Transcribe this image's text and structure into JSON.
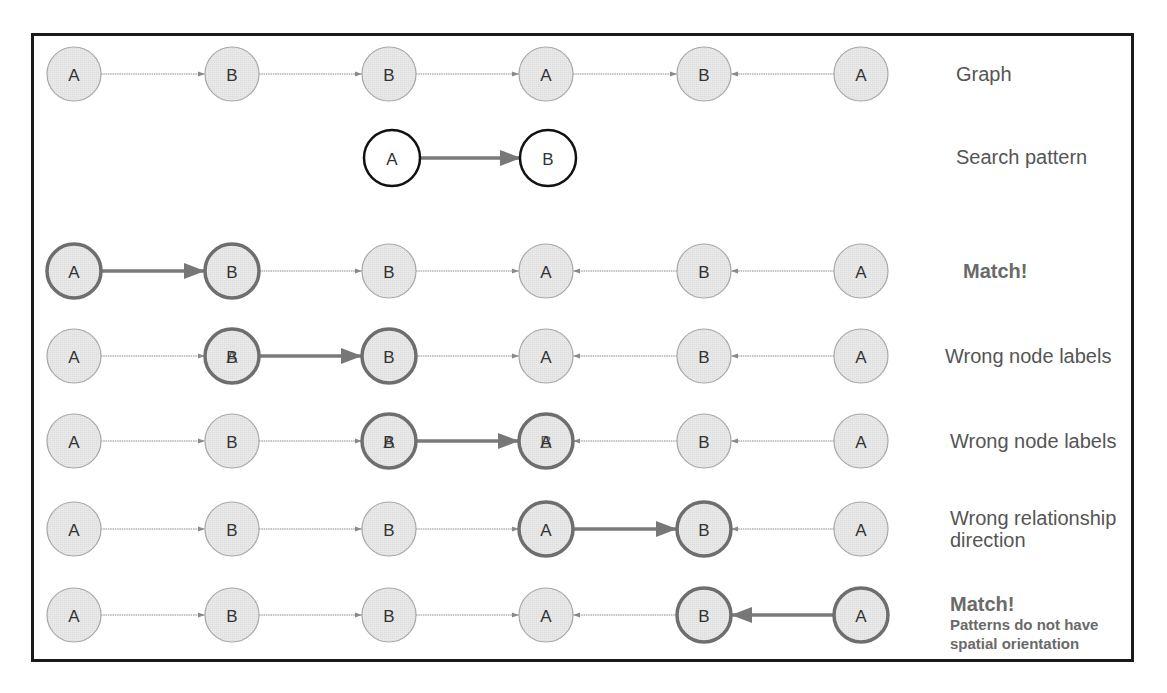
{
  "diagram": {
    "colors": {
      "node_fill": "#e6e6e6",
      "node_stroke": "#a8a8a8",
      "highlight_stroke": "#6e6e6e",
      "pattern_stroke": "#111111",
      "edge_thin": "#8a8a8a",
      "edge_thick": "#7a7a7a",
      "label_text": "#555555"
    },
    "node_x": [
      74,
      232,
      389,
      546,
      704,
      861
    ],
    "rows": [
      {
        "id": "graph",
        "y": 74,
        "label": "Graph",
        "sub": "",
        "bold": false,
        "nodes": [
          "A",
          "B",
          "B",
          "A",
          "B",
          "A"
        ],
        "overlay": [
          "",
          "",
          "",
          "",
          "",
          ""
        ],
        "edges": [
          "right",
          "right",
          "right",
          "right",
          "left"
        ],
        "highlight_nodes": [],
        "highlight_edge": -1
      },
      {
        "id": "match-1",
        "y": 271,
        "label": "Match!",
        "sub": "",
        "bold": true,
        "nodes": [
          "A",
          "B",
          "B",
          "A",
          "B",
          "A"
        ],
        "overlay": [
          "",
          "",
          "",
          "",
          "",
          ""
        ],
        "edges": [
          "right",
          "right",
          "right",
          "left",
          "left"
        ],
        "highlight_nodes": [
          0,
          1
        ],
        "highlight_edge": 0
      },
      {
        "id": "wrong-labels-1",
        "y": 356,
        "label": "Wrong node labels",
        "sub": "",
        "bold": false,
        "nodes": [
          "A",
          "B",
          "B",
          "A",
          "B",
          "A"
        ],
        "overlay": [
          "",
          "A",
          "",
          "",
          "",
          ""
        ],
        "edges": [
          "right",
          "right",
          "right",
          "left",
          "left"
        ],
        "highlight_nodes": [
          1,
          2
        ],
        "highlight_edge": 1
      },
      {
        "id": "wrong-labels-2",
        "y": 441,
        "label": "Wrong node labels",
        "sub": "",
        "bold": false,
        "nodes": [
          "A",
          "B",
          "B",
          "A",
          "B",
          "A"
        ],
        "overlay": [
          "",
          "",
          "A",
          "B",
          "",
          ""
        ],
        "edges": [
          "right",
          "right",
          "right",
          "left",
          "left"
        ],
        "highlight_nodes": [
          2,
          3
        ],
        "highlight_edge": 2
      },
      {
        "id": "wrong-direction",
        "y": 529,
        "label": "Wrong relationship",
        "sub": "direction",
        "bold": false,
        "nodes": [
          "A",
          "B",
          "B",
          "A",
          "B",
          "A"
        ],
        "overlay": [
          "",
          "",
          "",
          "",
          "",
          ""
        ],
        "edges": [
          "right",
          "right",
          "right",
          "right",
          "left"
        ],
        "highlight_nodes": [
          3,
          4
        ],
        "highlight_edge": 3
      },
      {
        "id": "match-2",
        "y": 615,
        "label": "Match!",
        "sub": "Patterns do not have spatial orientation",
        "bold": true,
        "nodes": [
          "A",
          "B",
          "B",
          "A",
          "B",
          "A"
        ],
        "overlay": [
          "",
          "",
          "",
          "",
          "",
          ""
        ],
        "edges": [
          "right",
          "right",
          "right",
          "left",
          "left"
        ],
        "highlight_nodes": [
          4,
          5
        ],
        "highlight_edge": 4
      }
    ],
    "search_pattern": {
      "y": 158,
      "label": "Search pattern",
      "nodes": [
        {
          "x": 392,
          "label": "A"
        },
        {
          "x": 548,
          "label": "B"
        }
      ],
      "edge": "right"
    },
    "labels": {
      "graph": "Graph",
      "search_pattern": "Search pattern",
      "match": "Match!",
      "wrong_node_labels": "Wrong node labels",
      "wrong_relationship_direction": "Wrong relationship direction",
      "no_spatial_orientation": "Patterns do not have spatial orientation"
    }
  }
}
